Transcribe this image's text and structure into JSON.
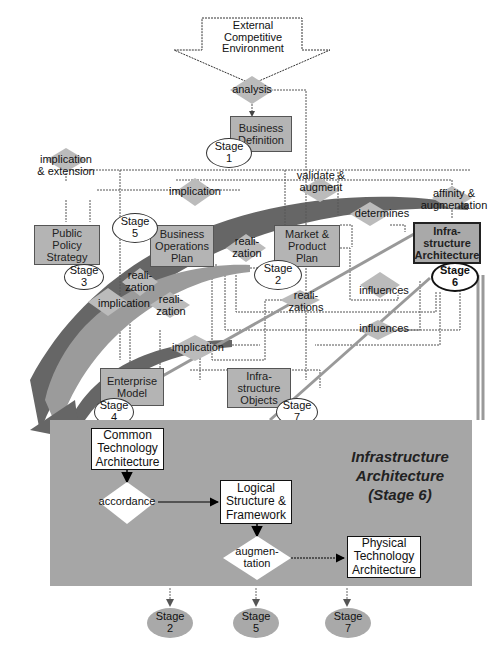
{
  "diagram": {
    "top_arrow": {
      "label": "External\nCompetitive\nEnvironment"
    },
    "boxes": [
      {
        "id": "business-definition",
        "label": "Business\nDefinition",
        "stage": "Stage\n1"
      },
      {
        "id": "public-policy-strategy",
        "label": "Public\nPolicy\nStrategy",
        "stage": "Stage\n3"
      },
      {
        "id": "business-operations-plan",
        "label": "Business\nOperations\nPlan",
        "stage": "Stage\n5"
      },
      {
        "id": "market-product-plan",
        "label": "Market &\nProduct\nPlan",
        "stage": "Stage\n2"
      },
      {
        "id": "infrastructure-architecture",
        "label": "Infra-\nstructure\nArchitecture",
        "stage": "Stage\n6"
      },
      {
        "id": "enterprise-model",
        "label": "Enterprise\nModel",
        "stage": "Stage\n4"
      },
      {
        "id": "infrastructure-objects",
        "label": "Infra-\nstructure\nObjects",
        "stage": "Stage\n7"
      }
    ],
    "relations": [
      "analysis",
      "implication\n& extension",
      "implication",
      "validate &\naugment",
      "determines",
      "affinity &\naugmentation",
      "reali-\nzation",
      "reali-\nzation",
      "implication",
      "reali-\nzation",
      "reali-\nzations",
      "influences",
      "influences",
      "implication"
    ],
    "detail_panel": {
      "title": "Infrastructure\nArchitecture\n(Stage 6)",
      "nodes": [
        "Common\nTechnology\nArchitecture",
        "Logical\nStructure &\nFramework",
        "Physical\nTechnology\nArchitecture"
      ],
      "relations": [
        "accordance",
        "augmen-\ntation"
      ],
      "outputs": [
        "Stage\n2",
        "Stage\n5",
        "Stage\n7"
      ]
    },
    "colors": {
      "box_fill": "#b4b4b4",
      "panel_fill": "#a6a6a6",
      "band_dark": "#5a5a5a",
      "band_light": "#9a9a9a",
      "diamond_fill": "#b9b9b9"
    }
  }
}
